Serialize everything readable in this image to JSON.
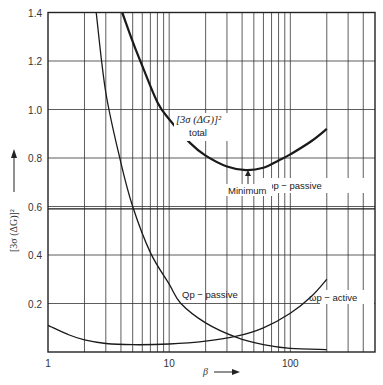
{
  "chart_data": {
    "type": "line",
    "title": "",
    "xlabel": "β",
    "ylabel": "[3σ (ΔG)]²",
    "xscale": "log",
    "xlim": [
      1,
      500
    ],
    "ylim": [
      0,
      1.4
    ],
    "grid": true,
    "x_tick_labels": [
      "1",
      "10",
      "100"
    ],
    "y_tick_labels": [
      "0.2",
      "0.4",
      "0.6",
      "0.8",
      "1.0",
      "1.2",
      "1.4"
    ],
    "series": [
      {
        "name": "[3σ (ΔG)]² total",
        "x": [
          4.1,
          5,
          6,
          8,
          10,
          15,
          20,
          30,
          43,
          60,
          80,
          100,
          150,
          200
        ],
        "values": [
          1.4,
          1.28,
          1.18,
          1.03,
          0.96,
          0.86,
          0.81,
          0.765,
          0.75,
          0.76,
          0.79,
          0.815,
          0.87,
          0.92
        ]
      },
      {
        "name": "Qp − passive",
        "x": [
          2.5,
          3,
          4,
          5,
          7,
          10,
          12.5,
          20,
          36,
          60,
          100,
          200
        ],
        "values": [
          1.4,
          1.07,
          0.78,
          0.6,
          0.41,
          0.28,
          0.2,
          0.12,
          0.06,
          0.03,
          0.015,
          0.01
        ]
      },
      {
        "name": "ωp − active",
        "x": [
          1,
          1.5,
          2,
          3,
          5,
          10,
          20,
          36,
          60,
          100,
          150,
          200
        ],
        "values": [
          0.11,
          0.07,
          0.05,
          0.035,
          0.03,
          0.033,
          0.045,
          0.065,
          0.1,
          0.16,
          0.23,
          0.3
        ]
      },
      {
        "name": "ωp − passive",
        "x": [
          1,
          500
        ],
        "values": [
          0.59,
          0.59
        ]
      }
    ],
    "annotations": [
      {
        "text": "Minimum",
        "x": 43,
        "y": 0.75,
        "arrow": true
      }
    ]
  },
  "labels": {
    "y_axis": "[3σ (ΔG)]²",
    "y_arrow": "⟶",
    "x_axis": "β",
    "x_arrow": "⟶",
    "total_line1": "[3σ (ΔG)]²",
    "total_line2": "total",
    "minimum": "Minimum",
    "wp_passive": "ωp − passive",
    "qp_passive": "Qp − passive",
    "wp_active": "ωp − active"
  },
  "ticks": {
    "y": [
      {
        "v": 0.2,
        "label": "0.2"
      },
      {
        "v": 0.4,
        "label": "0.4"
      },
      {
        "v": 0.6,
        "label": "0.6"
      },
      {
        "v": 0.8,
        "label": "0.8"
      },
      {
        "v": 1.0,
        "label": "1.0"
      },
      {
        "v": 1.2,
        "label": "1.2"
      },
      {
        "v": 1.4,
        "label": "1.4"
      }
    ],
    "x": [
      {
        "v": 1,
        "label": "1"
      },
      {
        "v": 10,
        "label": "10"
      },
      {
        "v": 100,
        "label": "100"
      }
    ]
  }
}
